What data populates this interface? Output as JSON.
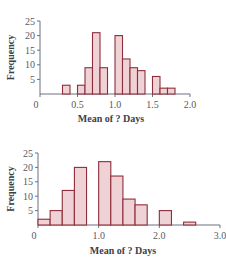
{
  "chart_data": [
    {
      "type": "bar",
      "title": "",
      "xlabel": "Mean of ? Days",
      "ylabel": "Frequency",
      "xlim": [
        0,
        2.0
      ],
      "ylim": [
        0,
        25
      ],
      "grid": false,
      "bin_width": 0.1,
      "x_ticks": [
        "0",
        "0.5",
        "1.0",
        "1.5",
        "2.0"
      ],
      "y_ticks": [
        "5",
        "10",
        "15",
        "20",
        "25"
      ],
      "bins": [
        {
          "x": 0.3,
          "count": 3
        },
        {
          "x": 0.5,
          "count": 3
        },
        {
          "x": 0.6,
          "count": 9
        },
        {
          "x": 0.7,
          "count": 21
        },
        {
          "x": 0.8,
          "count": 9
        },
        {
          "x": 1.0,
          "count": 20
        },
        {
          "x": 1.1,
          "count": 12
        },
        {
          "x": 1.2,
          "count": 9
        },
        {
          "x": 1.3,
          "count": 8
        },
        {
          "x": 1.5,
          "count": 6
        },
        {
          "x": 1.6,
          "count": 2
        },
        {
          "x": 1.7,
          "count": 2
        }
      ]
    },
    {
      "type": "bar",
      "title": "",
      "xlabel": "Mean of ? Days",
      "ylabel": "Frequency",
      "xlim": [
        0,
        3.0
      ],
      "ylim": [
        0,
        25
      ],
      "grid": false,
      "bin_width": 0.2,
      "x_ticks": [
        "0",
        "1.0",
        "2.0",
        "3.0"
      ],
      "y_ticks": [
        "5",
        "10",
        "15",
        "20",
        "25"
      ],
      "bins": [
        {
          "x": 0.0,
          "count": 2
        },
        {
          "x": 0.2,
          "count": 5
        },
        {
          "x": 0.4,
          "count": 12
        },
        {
          "x": 0.6,
          "count": 20
        },
        {
          "x": 0.8,
          "count": 0
        },
        {
          "x": 1.0,
          "count": 22
        },
        {
          "x": 1.2,
          "count": 17
        },
        {
          "x": 1.4,
          "count": 9
        },
        {
          "x": 1.6,
          "count": 7
        },
        {
          "x": 1.8,
          "count": 0
        },
        {
          "x": 2.0,
          "count": 5
        },
        {
          "x": 2.2,
          "count": 0
        },
        {
          "x": 2.4,
          "count": 1
        }
      ]
    }
  ],
  "colors": {
    "bar_fill": "#efd2d6",
    "bar_stroke": "#8e2e3a",
    "axis": "#6b7080",
    "text": "#3a3f4a"
  }
}
